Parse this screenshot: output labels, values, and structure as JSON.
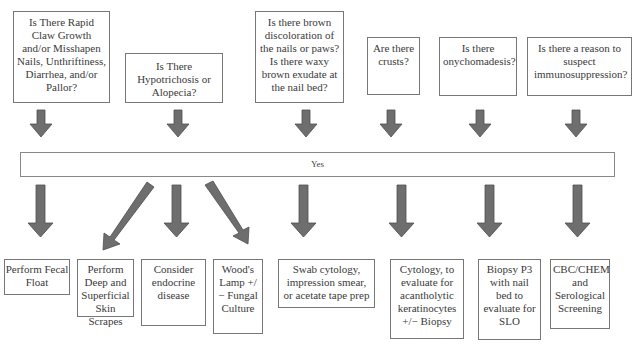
{
  "diagram": {
    "questions": [
      {
        "id": "q1",
        "text": "Is There Rapid Claw Growth and/or Misshapen Nails, Unthriftiness, Diarrhea, and/or Pallor?"
      },
      {
        "id": "q2",
        "text": "Is There Hypotrichosis or Alopecia?"
      },
      {
        "id": "q3",
        "text": "Is there brown discoloration of the nails or paws? Is there waxy brown exudate at the nail bed?"
      },
      {
        "id": "q4",
        "text": "Are there crusts?"
      },
      {
        "id": "q5",
        "text": "Is there onychomadesis?"
      },
      {
        "id": "q6",
        "text": "Is there a reason to suspect immunosuppression?"
      }
    ],
    "answer_bar": {
      "label": "Yes"
    },
    "actions": [
      {
        "id": "a1",
        "text": "Perform Fecal Float",
        "from": "q1"
      },
      {
        "id": "a2",
        "text": "Perform Deep and Superficial Skin Scrapes",
        "from": "q2"
      },
      {
        "id": "a3",
        "text": "Consider endocrine disease",
        "from": "q2"
      },
      {
        "id": "a4",
        "text": "Wood's Lamp +/− Fungal Culture",
        "from": "q2"
      },
      {
        "id": "a5",
        "text": "Swab cytology, impression smear, or acetate tape prep",
        "from": "q3"
      },
      {
        "id": "a6",
        "text": "Cytology, to evaluate for acantholytic keratinocytes +/− Biopsy",
        "from": "q4"
      },
      {
        "id": "a7",
        "text": "Biopsy P3 with nail bed to evaluate for SLO",
        "from": "q5"
      },
      {
        "id": "a8",
        "text": "CBC/CHEM and Serological Screening",
        "from": "q6"
      }
    ],
    "colors": {
      "arrow_fill": "#6e6e6e",
      "arrow_stroke": "#4e4e4e",
      "box_border": "#777777",
      "background": "#ffffff"
    }
  }
}
